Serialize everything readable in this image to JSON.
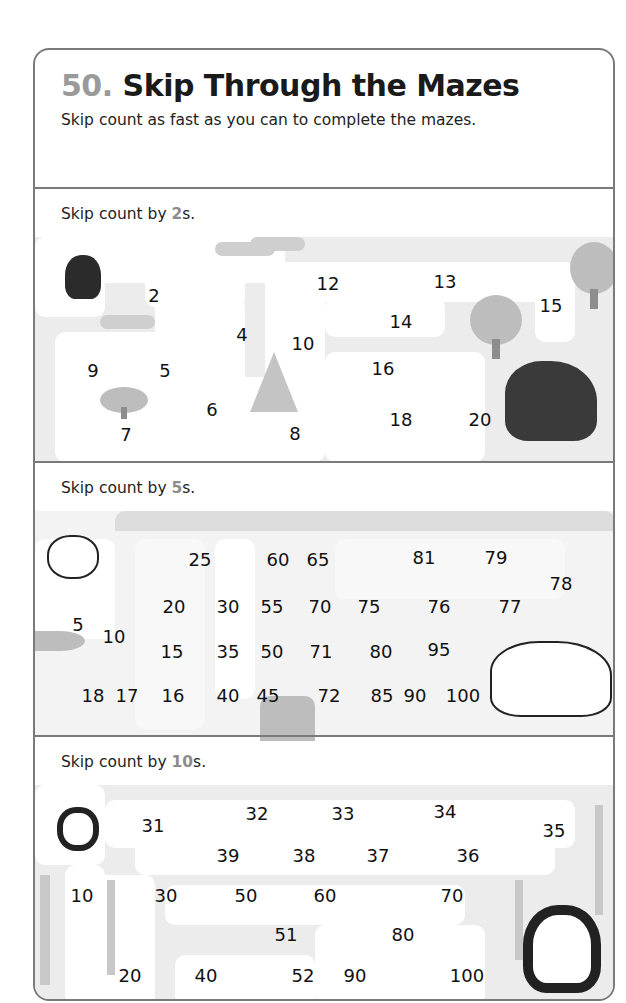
{
  "header": {
    "number": "50.",
    "title": "Skip Through the Mazes",
    "subtitle": "Skip count as fast as you can to complete the mazes."
  },
  "mazes": [
    {
      "prompt_prefix": "Skip count by ",
      "prompt_value": "2",
      "prompt_suffix": "s.",
      "start_animal": "small-black-bear",
      "end_animal": "black-bear",
      "numbers": [
        "2",
        "12",
        "13",
        "15",
        "14",
        "4",
        "10",
        "9",
        "5",
        "16",
        "6",
        "7",
        "8",
        "18",
        "20"
      ]
    },
    {
      "prompt_prefix": "Skip count by ",
      "prompt_value": "5",
      "prompt_suffix": "s.",
      "start_animal": "small-polar-bear",
      "end_animal": "polar-bear",
      "numbers": [
        "25",
        "60",
        "65",
        "81",
        "79",
        "78",
        "20",
        "30",
        "55",
        "70",
        "75",
        "76",
        "77",
        "5",
        "10",
        "15",
        "35",
        "50",
        "71",
        "80",
        "95",
        "18",
        "17",
        "16",
        "40",
        "45",
        "72",
        "85",
        "90",
        "100"
      ]
    },
    {
      "prompt_prefix": "Skip count by ",
      "prompt_value": "10",
      "prompt_suffix": "s.",
      "start_animal": "small-panda",
      "end_animal": "panda",
      "numbers": [
        "31",
        "32",
        "33",
        "34",
        "35",
        "39",
        "38",
        "37",
        "36",
        "10",
        "30",
        "50",
        "60",
        "70",
        "51",
        "80",
        "20",
        "40",
        "52",
        "90",
        "100"
      ]
    }
  ]
}
